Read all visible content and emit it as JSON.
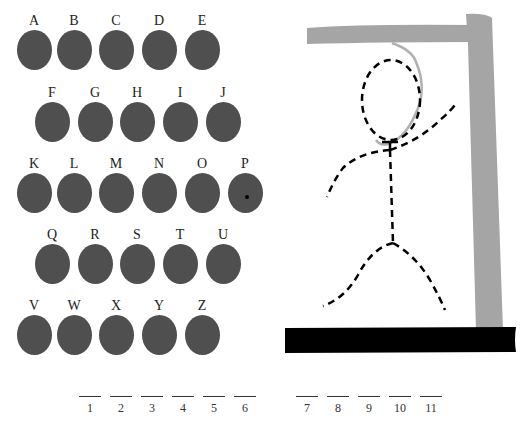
{
  "keyboard": {
    "rows": [
      [
        "A",
        "B",
        "C",
        "D",
        "E"
      ],
      [
        "F",
        "G",
        "H",
        "I",
        "J"
      ],
      [
        "K",
        "L",
        "M",
        "N",
        "O",
        "P"
      ],
      [
        "Q",
        "R",
        "S",
        "T",
        "U"
      ],
      [
        "V",
        "W",
        "X",
        "Y",
        "Z"
      ]
    ]
  },
  "letters": {
    "A": "A",
    "B": "B",
    "C": "C",
    "D": "D",
    "E": "E",
    "F": "F",
    "G": "G",
    "H": "H",
    "I": "I",
    "J": "J",
    "K": "K",
    "L": "L",
    "M": "M",
    "N": "N",
    "O": "O",
    "P": "P",
    "Q": "Q",
    "R": "R",
    "S": "S",
    "T": "T",
    "U": "U",
    "V": "V",
    "W": "W",
    "X": "X",
    "Y": "Y",
    "Z": "Z"
  },
  "word_slots": [
    "1",
    "2",
    "3",
    "4",
    "5",
    "6",
    "7",
    "8",
    "9",
    "10",
    "11"
  ],
  "colors": {
    "button": "#4f4f4f",
    "gallows_beam": "#a5a5a5",
    "base": "#000000",
    "figure": "#000000",
    "rope": "#b0b0b0"
  }
}
